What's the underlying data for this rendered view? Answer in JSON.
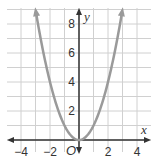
{
  "chart_data": {
    "type": "line",
    "title": "",
    "function": "y = x^2",
    "xlabel": "x",
    "ylabel": "y",
    "origin_label": "O",
    "xlim": [
      -4.8,
      5
    ],
    "ylim": [
      -0.8,
      9
    ],
    "x_ticks": [
      -4,
      -2,
      2,
      4
    ],
    "x_tick_labels": [
      "−4",
      "−2",
      "2",
      "4"
    ],
    "y_ticks": [
      2,
      4,
      6,
      8
    ],
    "y_tick_labels": [
      "2",
      "4",
      "6",
      "8"
    ],
    "grid": true,
    "grid_step": 1,
    "series": [
      {
        "name": "parabola",
        "x": [
          -3,
          -2.5,
          -2,
          -1.5,
          -1,
          -0.5,
          0,
          0.5,
          1,
          1.5,
          2,
          2.5,
          3
        ],
        "y": [
          9,
          6.25,
          4,
          2.25,
          1,
          0.25,
          0,
          0.25,
          1,
          2.25,
          4,
          6.25,
          9
        ],
        "arrows": "both-ends"
      }
    ],
    "colors": {
      "curve": "#9a9a9a",
      "axes": "#333333",
      "grid": "#d0d0d0"
    }
  }
}
